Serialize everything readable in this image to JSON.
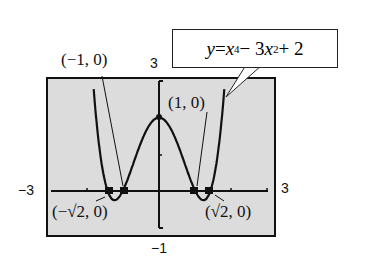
{
  "chart_data": {
    "type": "line",
    "title": "",
    "equation": "y = x^4 - 3x^2 + 2",
    "window": {
      "xmin": -3,
      "xmax": 3,
      "ymin": -1,
      "ymax": 3
    },
    "tick_labels": {
      "xmin": "−3",
      "xmax": "3",
      "ymin": "−1",
      "ymax": "3"
    },
    "grid": false,
    "series": [
      {
        "name": "y = x^4 - 3x^2 + 2",
        "x": [
          -1.9,
          -1.7,
          -1.5,
          -1.414,
          -1.3,
          -1.2,
          -1.0,
          -0.8,
          -0.6,
          -0.4,
          -0.2,
          0,
          0.2,
          0.4,
          0.6,
          0.8,
          1.0,
          1.2,
          1.3,
          1.414,
          1.5,
          1.7,
          1.9
        ],
        "y": [
          2.2,
          0.68,
          -0.19,
          0,
          -0.21,
          -0.25,
          0,
          0.49,
          1.05,
          1.55,
          1.88,
          2,
          1.88,
          1.55,
          1.05,
          0.49,
          0,
          -0.25,
          -0.21,
          0,
          -0.19,
          0.68,
          2.2
        ]
      }
    ],
    "annotations": [
      {
        "label": "(−1, 0)",
        "x": -1,
        "y": 0
      },
      {
        "label": "(1, 0)",
        "x": 1,
        "y": 0
      },
      {
        "label": "(−√2, 0)",
        "x": -1.414,
        "y": 0
      },
      {
        "label": "(√2, 0)",
        "x": 1.414,
        "y": 0
      },
      {
        "label": "(0, 2)",
        "x": 0,
        "y": 2,
        "marker_only": true
      }
    ]
  },
  "labels": {
    "callout_y": "y",
    "callout_eq": " = ",
    "callout_x1": "x",
    "callout_exp1": "4",
    "callout_mid": " − 3",
    "callout_x2": "x",
    "callout_exp2": "2",
    "callout_end": " + 2",
    "pt_neg1": "(−1, 0)",
    "pt_pos1": "(1, 0)",
    "pt_negsqrt2": "(−√2, 0)",
    "pt_possqrt2": "(√2, 0)",
    "xmin": "−3",
    "xmax": "3",
    "ymin": "−1",
    "ymax": "3"
  }
}
